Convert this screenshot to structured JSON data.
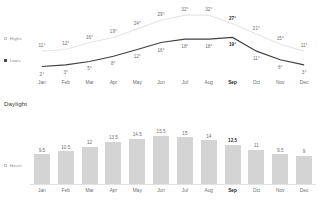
{
  "temperature_section": {
    "legend": [
      {
        "id": "highs",
        "label": "Highs",
        "marker": "open-square",
        "color": "#d9d9d9"
      },
      {
        "id": "lows",
        "label": "Lows",
        "marker": "solid-square",
        "color": "#4a4a4a"
      }
    ],
    "unit_suffix": "°"
  },
  "daylight_section": {
    "title": "Daylight",
    "legend": [
      {
        "id": "hours",
        "label": "Hours",
        "marker": "open-square",
        "color": "#d4d4d4"
      }
    ]
  },
  "months": [
    "Jan",
    "Feb",
    "Mar",
    "Apr",
    "May",
    "Jun",
    "Jul",
    "Aug",
    "Sep",
    "Oct",
    "Nov",
    "Dec"
  ],
  "highlighted_month": "Sep",
  "chart_data": [
    {
      "type": "line",
      "title": "",
      "xlabel": "",
      "ylabel": "",
      "categories": [
        "Jan",
        "Feb",
        "Mar",
        "Apr",
        "May",
        "Jun",
        "Jul",
        "Aug",
        "Sep",
        "Oct",
        "Nov",
        "Dec"
      ],
      "ylim": [
        0,
        35
      ],
      "grid": false,
      "legend_position": "left",
      "series": [
        {
          "name": "Highs",
          "color": "#e3e3e3",
          "values": [
            11,
            12,
            16,
            19,
            24,
            29,
            32,
            32,
            27,
            21,
            15,
            11
          ],
          "labels": [
            "11°",
            "12°",
            "16°",
            "19°",
            "24°",
            "29°",
            "32°",
            "32°",
            "27°",
            "21°",
            "15°",
            "11°"
          ],
          "bold_index": 8
        },
        {
          "name": "Lows",
          "color": "#4a4a4a",
          "values": [
            2,
            3,
            5,
            8,
            12,
            16,
            18,
            18,
            19,
            11,
            6,
            3
          ],
          "labels": [
            "2°",
            "3°",
            "5°",
            "8°",
            "12°",
            "16°",
            "18°",
            "18°",
            "19°",
            "11°",
            "6°",
            "3°"
          ],
          "bold_index": 8
        }
      ]
    },
    {
      "type": "bar",
      "title": "Daylight",
      "xlabel": "",
      "ylabel": "Hours",
      "categories": [
        "Jan",
        "Feb",
        "Mar",
        "Apr",
        "May",
        "Jun",
        "Jul",
        "Aug",
        "Sep",
        "Oct",
        "Nov",
        "Dec"
      ],
      "values": [
        9.5,
        10.5,
        12,
        13.5,
        14.5,
        15.5,
        15,
        14,
        12.5,
        11,
        9.5,
        9
      ],
      "labels": [
        "9.5",
        "10.5",
        "12",
        "13.5",
        "14.5",
        "15.5",
        "15",
        "14",
        "12.5",
        "11",
        "9.5",
        "9"
      ],
      "ylim": [
        0,
        16
      ],
      "grid": false,
      "bar_color": "#d4d4d4",
      "bold_index": 8,
      "legend_position": "left"
    }
  ]
}
